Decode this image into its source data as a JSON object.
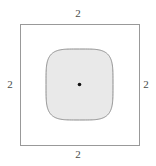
{
  "figure": {
    "width": 156,
    "height": 166,
    "background_color": "#ffffff"
  },
  "outer_square": {
    "name": "outer-square",
    "x": 20.5,
    "y": 24.5,
    "width": 119,
    "height": 121,
    "stroke_color": "#999999",
    "stroke_width": 1,
    "fill_color": "none"
  },
  "inner_shape": {
    "name": "squircle",
    "shape": "superellipse",
    "center_x": 79.5,
    "center_y": 84.5,
    "half_width": 33.5,
    "half_height": 35.5,
    "fill_color": "#e9e9e9",
    "stroke_color": "#8e8e8e",
    "stroke_width": 1
  },
  "center_point": {
    "name": "center-dot",
    "cx": 79.5,
    "cy": 84.5,
    "radius": 1.8,
    "color": "#111111"
  },
  "labels": {
    "top": "2",
    "right": "2",
    "bottom": "2",
    "left": "2",
    "color": "#4a4a4a"
  },
  "chart_data": {
    "type": "diagram",
    "shapes": [
      {
        "kind": "square",
        "side_label": "2",
        "fill": "none",
        "stroke": "#999999"
      },
      {
        "kind": "squircle",
        "fill": "#e9e9e9",
        "stroke": "#8e8e8e"
      },
      {
        "kind": "point",
        "label": "center",
        "fill": "#111111"
      }
    ],
    "annotations": [
      {
        "position": "top",
        "text": "2"
      },
      {
        "position": "right",
        "text": "2"
      },
      {
        "position": "bottom",
        "text": "2"
      },
      {
        "position": "left",
        "text": "2"
      }
    ]
  }
}
